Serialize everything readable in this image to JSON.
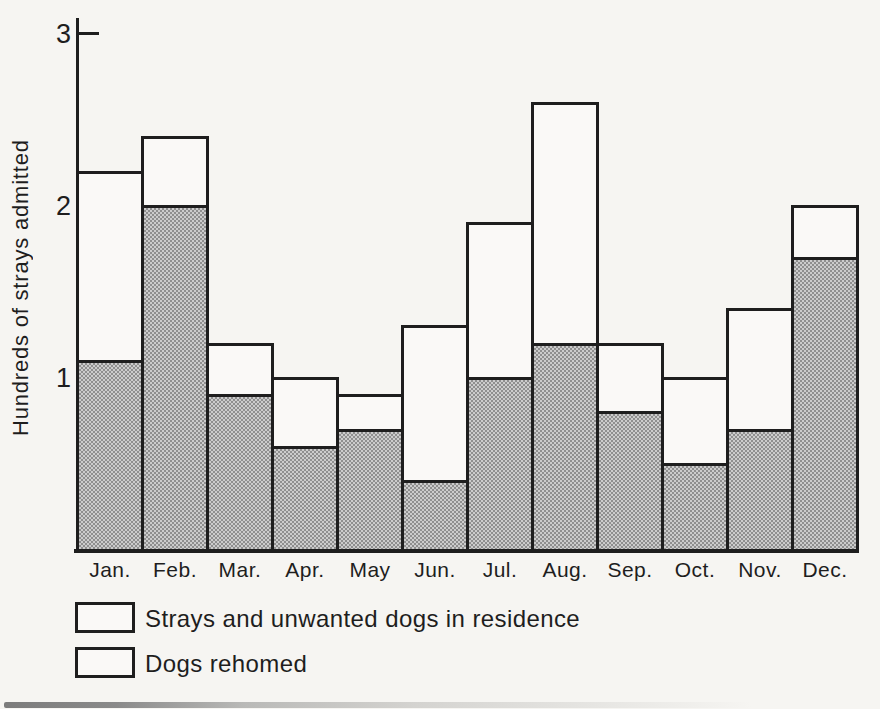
{
  "colors": {
    "ink": "#1e1e1e",
    "paper": "#f6f5f2",
    "bar_white_fill": "#faf9f7",
    "halftone_dark": "#8f8f8f",
    "halftone_light": "#cccccc"
  },
  "chart_data": {
    "type": "bar",
    "stacked": true,
    "title": "",
    "xlabel": "",
    "ylabel": "Hundreds of strays admitted",
    "ylim": [
      0,
      3
    ],
    "yticks": [
      1,
      2,
      3
    ],
    "grid": false,
    "legend_position": "bottom-left",
    "categories": [
      "Jan.",
      "Feb.",
      "Mar.",
      "Apr.",
      "May",
      "Jun.",
      "Jul.",
      "Aug.",
      "Sep.",
      "Oct.",
      "Nov.",
      "Dec."
    ],
    "series": [
      {
        "name": "Dogs rehomed",
        "swatch": "halftone-gray",
        "values": [
          1.1,
          2.0,
          0.9,
          0.6,
          0.7,
          0.4,
          1.0,
          1.2,
          0.8,
          0.5,
          0.7,
          1.7
        ]
      },
      {
        "name": "Strays and unwanted dogs in residence",
        "swatch": "white",
        "values": [
          1.1,
          0.4,
          0.3,
          0.4,
          0.2,
          0.9,
          0.9,
          1.4,
          0.4,
          0.5,
          0.7,
          0.3
        ]
      }
    ],
    "totals": [
      2.2,
      2.4,
      1.2,
      1.0,
      0.9,
      1.3,
      1.9,
      2.6,
      1.2,
      1.0,
      1.4,
      2.0
    ],
    "legend": [
      {
        "label": "Strays and unwanted dogs in residence",
        "swatch": "white"
      },
      {
        "label": "Dogs rehomed",
        "swatch": "halftone-gray"
      }
    ]
  }
}
